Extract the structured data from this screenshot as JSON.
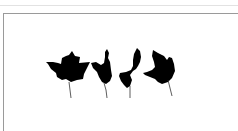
{
  "image": {
    "description": "Four black leaf silhouettes arranged in a row inside a bordered frame",
    "leaf_count": 4,
    "leaf_color": "#000000",
    "background": "#ffffff",
    "border_color": "#9a9a9a",
    "top_rule_color": "#e2e2e2",
    "leaves": [
      {
        "name": "leaf-1",
        "shape": "five-lobed maple leaf, facing up"
      },
      {
        "name": "leaf-2",
        "shape": "maple leaf, rotated/side view"
      },
      {
        "name": "leaf-3",
        "shape": "small maple leaf, tilted"
      },
      {
        "name": "leaf-4",
        "shape": "rounded maple leaf, side view"
      }
    ]
  }
}
